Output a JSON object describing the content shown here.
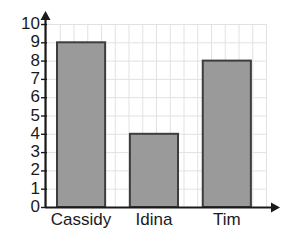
{
  "chart_data": {
    "type": "bar",
    "title": "",
    "xlabel": "",
    "ylabel": "",
    "categories": [
      "Cassidy",
      "Idina",
      "Tim"
    ],
    "values": [
      9,
      4,
      8
    ],
    "ylim": [
      0,
      10
    ],
    "ytick_labels": [
      "10",
      "9",
      "8",
      "7",
      "6",
      "5",
      "4",
      "3",
      "2",
      "1",
      "0"
    ],
    "ytick_values": [
      10,
      9,
      8,
      7,
      6,
      5,
      4,
      3,
      2,
      1,
      0
    ],
    "grid": true,
    "legend": "none",
    "colors": {
      "bar_fill": "#9a9a9a",
      "bar_stroke": "#3d3d3d",
      "grid": "#e2e2e2",
      "axis": "#1a1a1a",
      "background": "#ffffff",
      "text": "#1a1a1a"
    }
  }
}
